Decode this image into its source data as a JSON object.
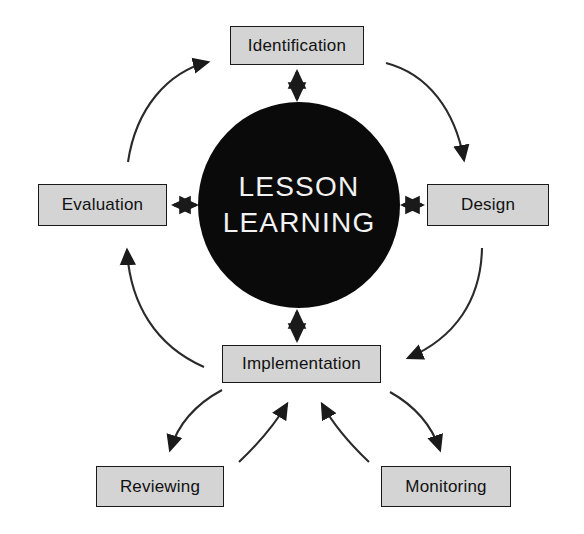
{
  "diagram": {
    "type": "cycle-diagram",
    "hub": {
      "line1": "LESSON",
      "line2": "LEARNING",
      "shape": "circle",
      "fill": "#0a0a0a",
      "text_color": "#f2f2f2"
    },
    "style": {
      "box_fill": "#d4d4d4",
      "box_border": "#1a1a1a",
      "box_text": "#111111",
      "arrow_color": "#1a1a1a",
      "background": "#ffffff"
    },
    "nodes": [
      {
        "id": "identification",
        "label": "Identification",
        "position": "top"
      },
      {
        "id": "design",
        "label": "Design",
        "position": "right"
      },
      {
        "id": "implementation",
        "label": "Implementation",
        "position": "bottom-center"
      },
      {
        "id": "evaluation",
        "label": "Evaluation",
        "position": "left"
      },
      {
        "id": "reviewing",
        "label": "Reviewing",
        "position": "bottom-left"
      },
      {
        "id": "monitoring",
        "label": "Monitoring",
        "position": "bottom-right"
      }
    ],
    "connectors": [
      {
        "id": "hub-identification",
        "from": "LESSON LEARNING",
        "to": "Identification",
        "style": "straight",
        "arrowheads": "both"
      },
      {
        "id": "hub-design",
        "from": "LESSON LEARNING",
        "to": "Design",
        "style": "straight",
        "arrowheads": "both"
      },
      {
        "id": "hub-evaluation",
        "from": "LESSON LEARNING",
        "to": "Evaluation",
        "style": "straight",
        "arrowheads": "both"
      },
      {
        "id": "hub-implementation",
        "from": "LESSON LEARNING",
        "to": "Implementation",
        "style": "straight",
        "arrowheads": "both"
      },
      {
        "id": "evaluation-identification",
        "from": "Evaluation",
        "to": "Identification",
        "style": "curved",
        "arrowheads": "end"
      },
      {
        "id": "identification-design",
        "from": "Identification",
        "to": "Design",
        "style": "curved",
        "arrowheads": "end"
      },
      {
        "id": "design-implementation",
        "from": "Design",
        "to": "Implementation",
        "style": "curved",
        "arrowheads": "end"
      },
      {
        "id": "implementation-evaluation",
        "from": "Implementation",
        "to": "Evaluation",
        "style": "curved",
        "arrowheads": "end"
      },
      {
        "id": "implementation-reviewing",
        "from": "Implementation",
        "to": "Reviewing",
        "style": "curved",
        "arrowheads": "end"
      },
      {
        "id": "implementation-monitoring",
        "from": "Implementation",
        "to": "Monitoring",
        "style": "curved",
        "arrowheads": "end"
      },
      {
        "id": "reviewing-implementation",
        "from": "Reviewing",
        "to": "Implementation",
        "style": "curved",
        "arrowheads": "end"
      },
      {
        "id": "monitoring-implementation",
        "from": "Monitoring",
        "to": "Implementation",
        "style": "curved",
        "arrowheads": "end"
      }
    ]
  }
}
